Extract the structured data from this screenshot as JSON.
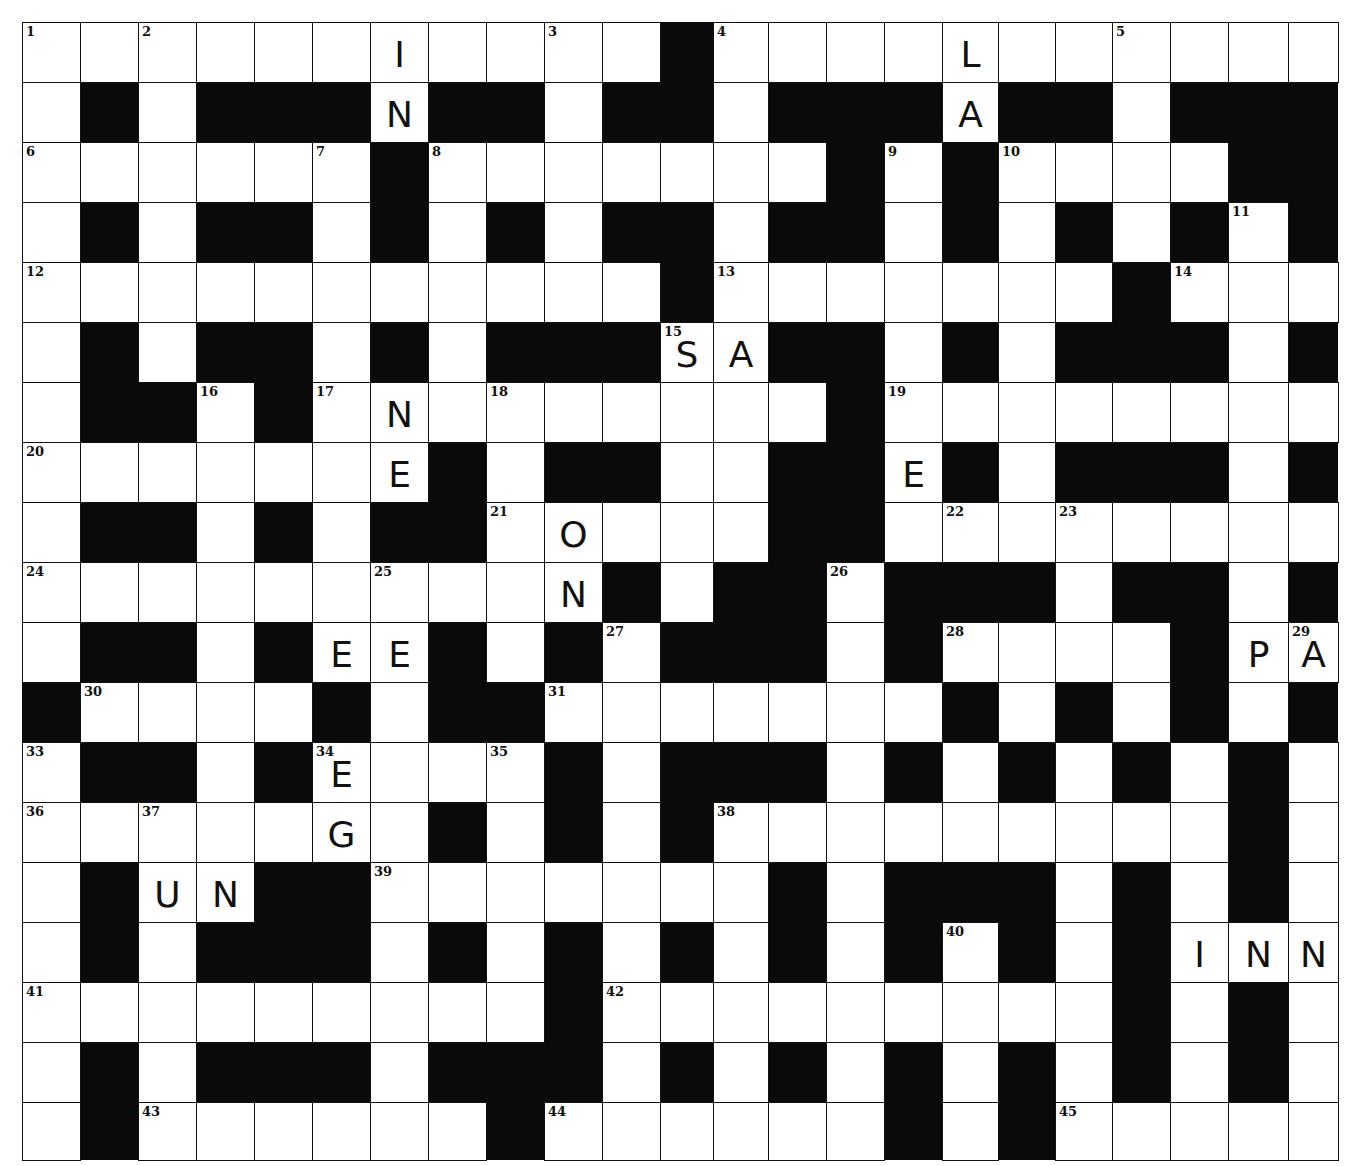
{
  "puzzle": {
    "rows": 19,
    "cols": 23,
    "col_edges": [
      22,
      80,
      138,
      196,
      254,
      312,
      370,
      428,
      486,
      544,
      602,
      660,
      713,
      768,
      826,
      884,
      942,
      998,
      1055,
      1112,
      1170,
      1228,
      1288,
      1338
    ],
    "row_edges": [
      22,
      82,
      142,
      202,
      262,
      322,
      382,
      442,
      502,
      562,
      622,
      682,
      742,
      802,
      862,
      922,
      982,
      1042,
      1102,
      1160
    ],
    "grid": [
      "...........#...........",
      ".#.###.##.##.###.##.###",
      "......#.......#.#....##",
      ".#.##.#.#.##.##.#.#.#.#",
      "...........#.......#...",
      ".#.##.#.###..##.#.###.#",
      ".##.#.........#........",
      ".......#.##..##.#.###.#",
      ".##.#.##.....##........",
      "..........#.##.###.##.#",
      ".##.#..#.#.###.#....#..",
      "#....#.##.......#.#.#.#",
      ".##.#....#.###.#.#.#.#.",
      ".......#.#.#.........#.",
      ".#..##.......#.###.#.#.",
      ".#.###.#.#.#.#.#.#.#...",
      ".........#.........#.#.",
      ".#.###.###.#.#.#.#.#.#.",
      ".#......#......#.#....."
    ],
    "numbers": [
      {
        "n": "1",
        "r": 0,
        "c": 0
      },
      {
        "n": "2",
        "r": 0,
        "c": 2
      },
      {
        "n": "3",
        "r": 0,
        "c": 9
      },
      {
        "n": "4",
        "r": 0,
        "c": 12
      },
      {
        "n": "5",
        "r": 0,
        "c": 19
      },
      {
        "n": "6",
        "r": 2,
        "c": 0
      },
      {
        "n": "7",
        "r": 2,
        "c": 5
      },
      {
        "n": "8",
        "r": 2,
        "c": 7
      },
      {
        "n": "9",
        "r": 2,
        "c": 15
      },
      {
        "n": "10",
        "r": 2,
        "c": 17
      },
      {
        "n": "11",
        "r": 3,
        "c": 21
      },
      {
        "n": "12",
        "r": 4,
        "c": 0
      },
      {
        "n": "13",
        "r": 4,
        "c": 12
      },
      {
        "n": "14",
        "r": 4,
        "c": 20
      },
      {
        "n": "15",
        "r": 5,
        "c": 11
      },
      {
        "n": "16",
        "r": 6,
        "c": 3
      },
      {
        "n": "17",
        "r": 6,
        "c": 5
      },
      {
        "n": "18",
        "r": 6,
        "c": 8
      },
      {
        "n": "19",
        "r": 6,
        "c": 15
      },
      {
        "n": "20",
        "r": 7,
        "c": 0
      },
      {
        "n": "21",
        "r": 8,
        "c": 8
      },
      {
        "n": "22",
        "r": 8,
        "c": 16
      },
      {
        "n": "23",
        "r": 8,
        "c": 18
      },
      {
        "n": "24",
        "r": 9,
        "c": 0
      },
      {
        "n": "25",
        "r": 9,
        "c": 6
      },
      {
        "n": "26",
        "r": 9,
        "c": 14
      },
      {
        "n": "27",
        "r": 10,
        "c": 10
      },
      {
        "n": "28",
        "r": 10,
        "c": 16
      },
      {
        "n": "29",
        "r": 10,
        "c": 22
      },
      {
        "n": "30",
        "r": 11,
        "c": 1
      },
      {
        "n": "31",
        "r": 11,
        "c": 9
      },
      {
        "n": "32",
        "r": 11,
        "c": 20
      },
      {
        "n": "33",
        "r": 12,
        "c": 0
      },
      {
        "n": "34",
        "r": 12,
        "c": 5
      },
      {
        "n": "35",
        "r": 12,
        "c": 8
      },
      {
        "n": "36",
        "r": 13,
        "c": 0
      },
      {
        "n": "37",
        "r": 13,
        "c": 2
      },
      {
        "n": "38",
        "r": 13,
        "c": 12
      },
      {
        "n": "39",
        "r": 14,
        "c": 6
      },
      {
        "n": "40",
        "r": 15,
        "c": 16
      },
      {
        "n": "41",
        "r": 16,
        "c": 0
      },
      {
        "n": "42",
        "r": 16,
        "c": 10
      },
      {
        "n": "43",
        "r": 18,
        "c": 2
      },
      {
        "n": "44",
        "r": 18,
        "c": 9
      },
      {
        "n": "45",
        "r": 18,
        "c": 18
      }
    ],
    "letters": [
      {
        "ch": "I",
        "r": 0,
        "c": 6
      },
      {
        "ch": "N",
        "r": 1,
        "c": 6
      },
      {
        "ch": "L",
        "r": 0,
        "c": 16
      },
      {
        "ch": "A",
        "r": 1,
        "c": 16
      },
      {
        "ch": "S",
        "r": 5,
        "c": 11
      },
      {
        "ch": "A",
        "r": 5,
        "c": 12
      },
      {
        "ch": "N",
        "r": 6,
        "c": 6
      },
      {
        "ch": "E",
        "r": 7,
        "c": 6
      },
      {
        "ch": "H",
        "r": 7,
        "c": 14
      },
      {
        "ch": "E",
        "r": 7,
        "c": 15
      },
      {
        "ch": "O",
        "r": 8,
        "c": 9
      },
      {
        "ch": "N",
        "r": 9,
        "c": 9
      },
      {
        "ch": "E",
        "r": 10,
        "c": 5
      },
      {
        "ch": "E",
        "r": 10,
        "c": 6
      },
      {
        "ch": "P",
        "r": 10,
        "c": 21
      },
      {
        "ch": "A",
        "r": 10,
        "c": 22
      },
      {
        "ch": "E",
        "r": 12,
        "c": 5
      },
      {
        "ch": "G",
        "r": 13,
        "c": 5
      },
      {
        "ch": "U",
        "r": 14,
        "c": 2
      },
      {
        "ch": "N",
        "r": 14,
        "c": 3
      },
      {
        "ch": "I",
        "r": 15,
        "c": 20
      },
      {
        "ch": "N",
        "r": 15,
        "c": 21
      },
      {
        "ch": "N",
        "r": 15,
        "c": 22
      }
    ],
    "colors": {
      "block": "#0a0a0a",
      "cell": "#ffffff",
      "ink": "#111111"
    }
  }
}
